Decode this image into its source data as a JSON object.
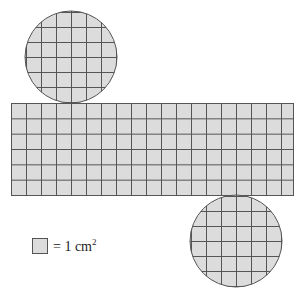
{
  "figure": {
    "colors": {
      "fill": "#dcdcdc",
      "grid_line": "#555555",
      "outline": "#555555",
      "background": "#ffffff"
    },
    "cell_px": 15,
    "rectangle": {
      "x": 11,
      "y": 103,
      "width": 282,
      "height": 92,
      "columns": 19,
      "rows": 6
    },
    "top_circle": {
      "cx": 71,
      "cy": 57,
      "r": 46
    },
    "bottom_circle": {
      "cx": 236,
      "cy": 241,
      "r": 46
    }
  },
  "legend": {
    "swatch_label": "unit-square",
    "text": "= 1 cm",
    "superscript": "2"
  }
}
